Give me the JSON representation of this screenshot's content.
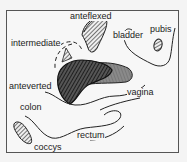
{
  "diagram": {
    "title": "",
    "labels": {
      "anteflexed": "anteflexed",
      "intermediate": "intermediate",
      "bladder": "bladder",
      "pubis": "pubis",
      "anteverted": "anteverted",
      "vagina": "vagina",
      "colon": "colon",
      "rectum": "rectum",
      "coccyx": "coccys"
    },
    "nodes": [
      {
        "id": "anteflexed",
        "type": "uterus-position",
        "fill": "hatched-light"
      },
      {
        "id": "intermediate",
        "type": "uterus-position",
        "outline": "dashed"
      },
      {
        "id": "anteverted",
        "type": "uterus-position",
        "fill": "dark-hatched"
      },
      {
        "id": "bladder",
        "type": "organ-outline"
      },
      {
        "id": "pubis",
        "type": "bone",
        "fill": "hatched"
      },
      {
        "id": "vagina",
        "type": "organ",
        "fill": "grey"
      },
      {
        "id": "colon",
        "type": "organ-outline"
      },
      {
        "id": "rectum",
        "type": "organ-outline"
      },
      {
        "id": "coccys",
        "type": "bone",
        "fill": "hatched"
      }
    ]
  }
}
